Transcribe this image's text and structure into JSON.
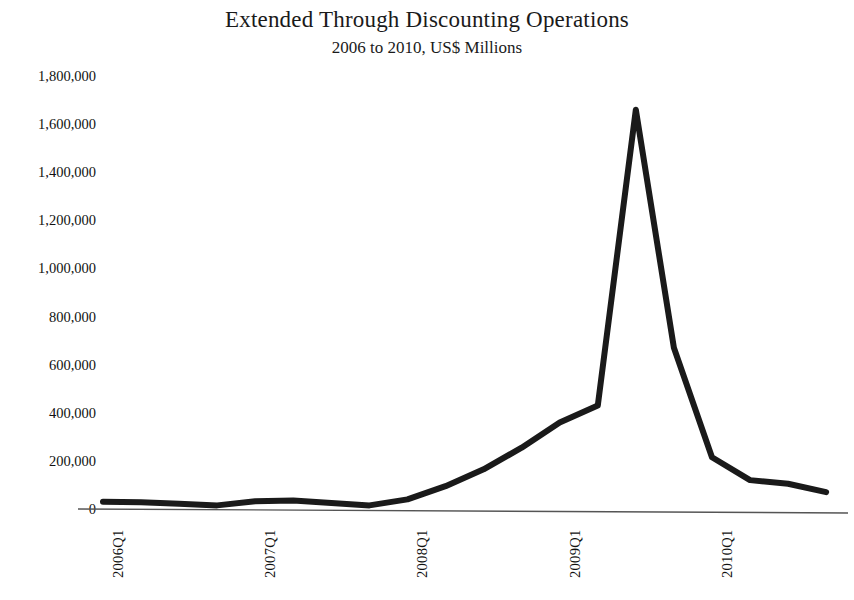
{
  "chart_data": {
    "type": "line",
    "title": "Extended Through Discounting Operations",
    "subtitle": "2006 to 2010, US$ Millions",
    "xlabel": "",
    "ylabel": "",
    "ylim": [
      0,
      1800000
    ],
    "ytick_step": 200000,
    "yticks": [
      "1,800,000",
      "1,600,000",
      "1,400,000",
      "1,200,000",
      "1,000,000",
      "800,000",
      "600,000",
      "400,000",
      "200,000",
      "0"
    ],
    "ytick_values": [
      1800000,
      1600000,
      1400000,
      1200000,
      1000000,
      800000,
      600000,
      400000,
      200000,
      0
    ],
    "xticks": [
      "2006Q1",
      "2007Q1",
      "2008Q1",
      "2009Q1",
      "2010Q1"
    ],
    "xtick_quarter_index": [
      0,
      4,
      8,
      12,
      16
    ],
    "grid": false,
    "legend": "none",
    "line_color": "#1a1a1a",
    "line_width_px": 6,
    "axis_color": "#555555",
    "x": [
      "2006Q1",
      "2006Q2",
      "2006Q3",
      "2006Q4",
      "2007Q1",
      "2007Q2",
      "2007Q3",
      "2007Q4",
      "2008Q1",
      "2008Q2",
      "2008Q3",
      "2008Q4",
      "2009Q1",
      "2009Q2",
      "2009Q3",
      "2009Q4",
      "2010Q1",
      "2010Q2",
      "2010Q3",
      "2010Q4"
    ],
    "values": [
      30000,
      28000,
      22000,
      15000,
      32000,
      35000,
      25000,
      15000,
      40000,
      95000,
      165000,
      255000,
      360000,
      430000,
      1660000,
      670000,
      215000,
      120000,
      105000,
      70000
    ],
    "series": [
      {
        "name": "Extended Through Discounting Operations",
        "values": [
          30000,
          28000,
          22000,
          15000,
          32000,
          35000,
          25000,
          15000,
          40000,
          95000,
          165000,
          255000,
          360000,
          430000,
          1660000,
          670000,
          215000,
          120000,
          105000,
          70000
        ]
      }
    ],
    "peak": {
      "label": "2009Q3",
      "value": 1660000
    }
  }
}
